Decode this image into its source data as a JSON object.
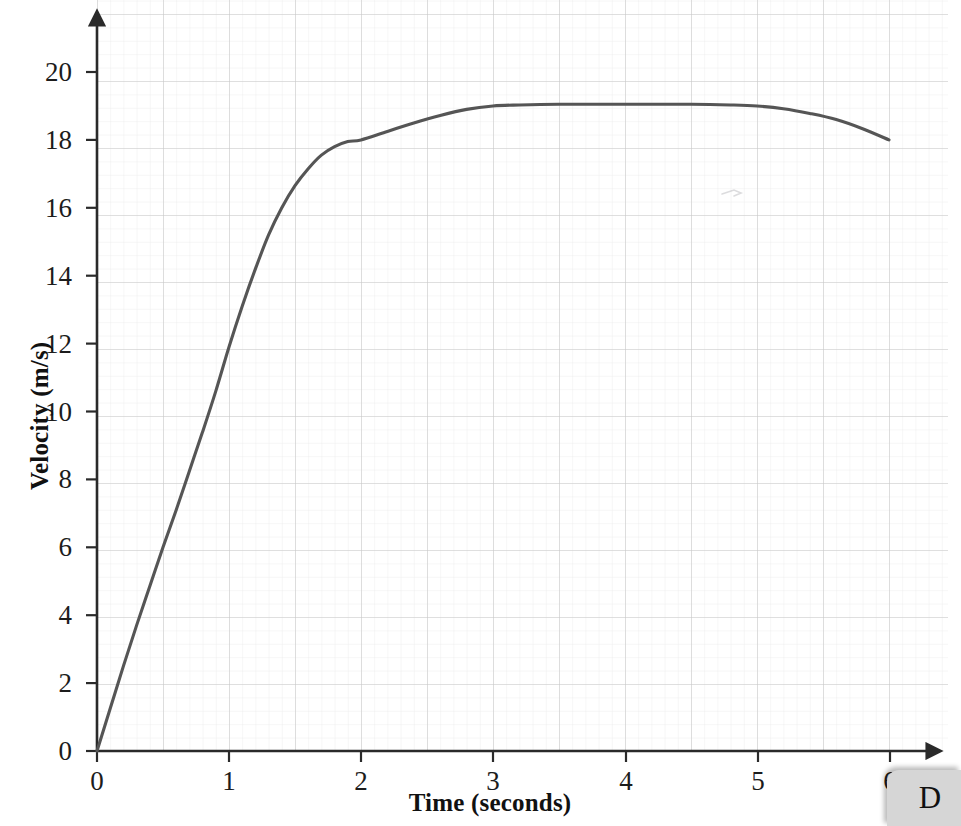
{
  "chart_data": {
    "type": "line",
    "title": "",
    "xlabel": "Time (seconds)",
    "ylabel": "Velocity (m/s)",
    "xlim": [
      0,
      6.4
    ],
    "ylim": [
      0,
      21.7
    ],
    "xticks": [
      "0",
      "1",
      "2",
      "3",
      "4",
      "5",
      "6"
    ],
    "xtick_values": [
      0,
      1,
      2,
      3,
      4,
      5,
      6
    ],
    "yticks": [
      "0",
      "2",
      "4",
      "6",
      "8",
      "10",
      "12",
      "14",
      "16",
      "18",
      "20"
    ],
    "ytick_values": [
      0,
      2,
      4,
      6,
      8,
      10,
      12,
      14,
      16,
      18,
      20
    ],
    "grid": "minor and major graph paper grid",
    "grid_major_color": "#c9c9c9",
    "grid_minor_color": "#e8e8e8",
    "legend": "none",
    "series": [
      {
        "name": "velocity",
        "color": "#555555",
        "x": [
          0,
          0.1,
          0.2,
          0.3,
          0.4,
          0.5,
          0.6,
          0.7,
          0.8,
          0.9,
          1.0,
          1.1,
          1.2,
          1.3,
          1.4,
          1.5,
          1.6,
          1.7,
          1.8,
          1.9,
          2.0,
          2.2,
          2.4,
          2.6,
          2.8,
          3.0,
          3.2,
          3.5,
          4.0,
          4.5,
          4.8,
          5.0,
          5.2,
          5.4,
          5.6,
          5.8,
          6.0
        ],
        "y": [
          0,
          1.25,
          2.5,
          3.7,
          4.85,
          6.0,
          7.1,
          8.25,
          9.4,
          10.6,
          11.9,
          13.1,
          14.2,
          15.2,
          16.0,
          16.65,
          17.15,
          17.55,
          17.8,
          17.95,
          18.0,
          18.25,
          18.5,
          18.72,
          18.9,
          19.0,
          19.03,
          19.05,
          19.05,
          19.05,
          19.03,
          19.0,
          18.92,
          18.78,
          18.6,
          18.33,
          18.0
        ]
      }
    ],
    "annotations": [
      {
        "name": "faint-pencil-mark",
        "x": 4.8,
        "y": 16.5
      }
    ]
  },
  "corner": {
    "label": "D"
  },
  "axes": {
    "x_arrow": true,
    "y_arrow": true,
    "axis_color": "#2a2a2a"
  }
}
